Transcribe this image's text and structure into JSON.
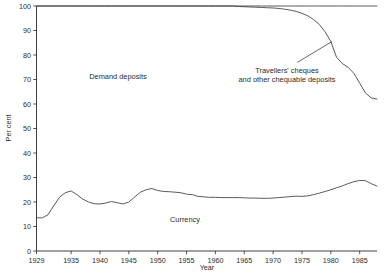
{
  "chart_data": {
    "type": "line",
    "title": "",
    "xlabel": "Year",
    "ylabel": "Per cent",
    "xlim": [
      1929,
      1988
    ],
    "ylim": [
      0,
      100
    ],
    "grid": false,
    "legend_position": "inline-annotations",
    "x_ticks": [
      1929,
      1935,
      1940,
      1945,
      1950,
      1955,
      1960,
      1965,
      1970,
      1975,
      1980,
      1985
    ],
    "x_tick_labels": [
      "1929",
      "1935",
      "1940",
      "1945",
      "1950",
      "1955",
      "1960",
      "1965",
      "1970",
      "1975",
      "1980",
      "1985"
    ],
    "y_ticks": [
      0,
      10,
      20,
      30,
      40,
      50,
      60,
      70,
      80,
      90,
      100
    ],
    "y_tick_labels": [
      "0",
      "10",
      "20",
      "30",
      "40",
      "50",
      "60",
      "70",
      "80",
      "90",
      "100"
    ],
    "annotations": [
      {
        "name": "demand-deposits-label",
        "text": "Demand deposits",
        "x": 1945.0,
        "y": 70.5
      },
      {
        "name": "travellers-cheques-label",
        "text": "Travellers' cheques",
        "x": 1973.0,
        "y": 73.0
      },
      {
        "name": "travellers-cheques-label-line2",
        "text": "and other chequable deposits",
        "x": 1973.0,
        "y": 69.0
      },
      {
        "name": "currency-label",
        "text": "Currency",
        "x": 1956.5,
        "y": 15.5
      }
    ],
    "leader_line": {
      "name": "travellers-cheques-leader",
      "from": [
        1974.2,
        77.0
      ],
      "to": [
        1980.2,
        85.5
      ]
    },
    "x": [
      1929,
      1930,
      1931,
      1932,
      1933,
      1934,
      1935,
      1936,
      1937,
      1938,
      1939,
      1940,
      1941,
      1942,
      1943,
      1944,
      1945,
      1946,
      1947,
      1948,
      1949,
      1950,
      1951,
      1952,
      1953,
      1954,
      1955,
      1956,
      1957,
      1958,
      1959,
      1960,
      1961,
      1962,
      1963,
      1964,
      1965,
      1966,
      1967,
      1968,
      1969,
      1970,
      1971,
      1972,
      1973,
      1974,
      1975,
      1976,
      1977,
      1978,
      1979,
      1980,
      1981,
      1982,
      1983,
      1984,
      1985,
      1986,
      1987,
      1988
    ],
    "series": [
      {
        "name": "Cumulative total (100 per cent)",
        "values": [
          100,
          100,
          100,
          100,
          100,
          100,
          100,
          100,
          100,
          100,
          100,
          100,
          100,
          100,
          100,
          100,
          100,
          100,
          100,
          100,
          100,
          100,
          100,
          100,
          100,
          100,
          100,
          100,
          100,
          100,
          100,
          100,
          100,
          100,
          100,
          100,
          100,
          100,
          100,
          100,
          100,
          100,
          100,
          100,
          100,
          100,
          100,
          100,
          100,
          100,
          100,
          100,
          100,
          100,
          100,
          100,
          100,
          100,
          100,
          100
        ]
      },
      {
        "name": "Demand deposits plus currency (top of demand deposits band)",
        "values": [
          100,
          100,
          100,
          100,
          100,
          100,
          100,
          100,
          100,
          100,
          100,
          100,
          100,
          100,
          100,
          100,
          100,
          100,
          100,
          100,
          100,
          100,
          100,
          100,
          100,
          100,
          100,
          100,
          100,
          100,
          100,
          100,
          100,
          100,
          100,
          99.8,
          99.7,
          99.6,
          99.5,
          99.4,
          99.3,
          99.2,
          99.0,
          98.7,
          98.3,
          97.8,
          97.0,
          96.0,
          94.5,
          92.5,
          89.5,
          85.5,
          79.0,
          76.5,
          75.0,
          72.5,
          68.5,
          64.5,
          62.5,
          62.0
        ]
      },
      {
        "name": "Currency",
        "values": [
          13.6,
          13.5,
          14.8,
          18.5,
          22.0,
          23.8,
          24.5,
          23.0,
          21.2,
          20.0,
          19.3,
          19.2,
          19.6,
          20.2,
          19.7,
          19.2,
          20.0,
          22.0,
          24.0,
          25.0,
          25.5,
          24.7,
          24.3,
          24.2,
          24.0,
          23.8,
          23.2,
          23.0,
          22.3,
          22.1,
          21.9,
          21.9,
          21.8,
          21.8,
          21.8,
          21.8,
          21.7,
          21.6,
          21.6,
          21.5,
          21.5,
          21.6,
          21.8,
          22.0,
          22.2,
          22.4,
          22.3,
          22.5,
          23.0,
          23.6,
          24.3,
          25.0,
          25.8,
          26.6,
          27.5,
          28.3,
          28.8,
          28.7,
          27.5,
          26.5
        ]
      }
    ]
  },
  "labels": {
    "y_axis_title": "Per cent",
    "x_axis_title": "Year",
    "demand_deposits": "Demand deposits",
    "travellers_cheques_line1": "Travellers' cheques",
    "travellers_cheques_line2": "and other chequable deposits",
    "currency": "Currency"
  }
}
